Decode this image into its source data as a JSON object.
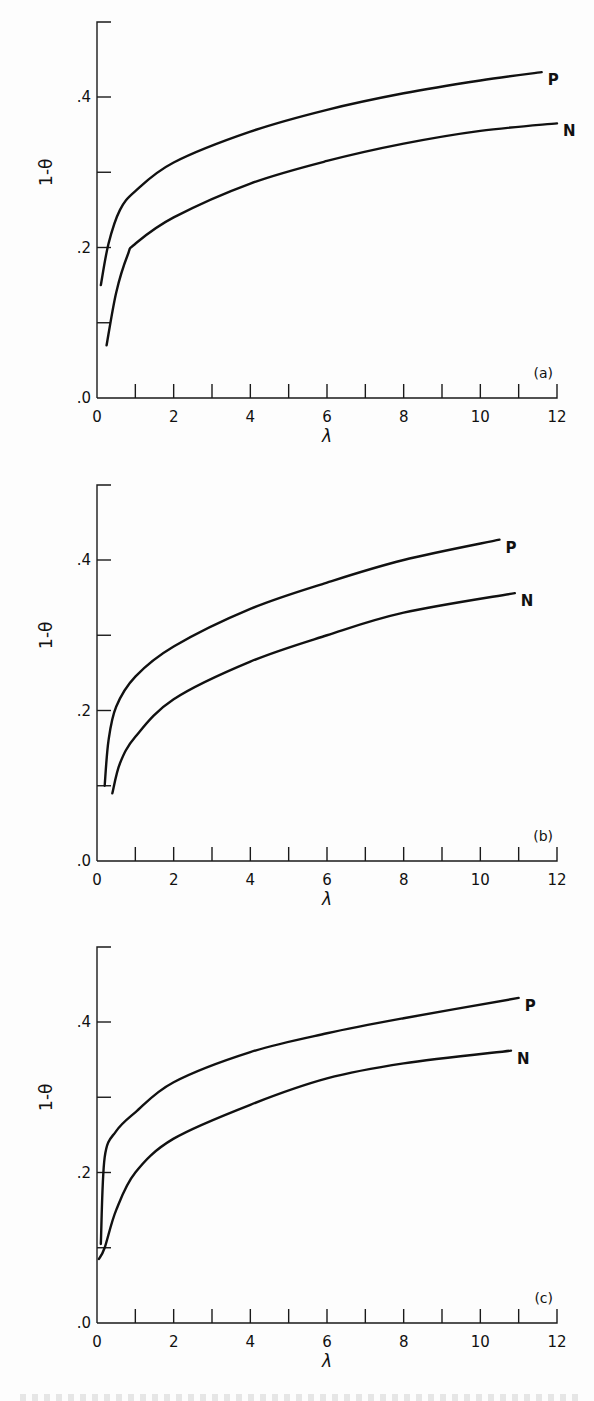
{
  "figure": {
    "y_label": "1-θ",
    "x_label": "λ",
    "x_ticks": [
      "0",
      "2",
      "4",
      "6",
      "8",
      "10",
      "12"
    ],
    "y_ticks": [
      ".0",
      ".2",
      ".4"
    ]
  },
  "chart_data": [
    {
      "type": "line",
      "panel_label": "(a)",
      "xlabel": "λ",
      "ylabel": "1-θ",
      "xlim": [
        0,
        12
      ],
      "ylim": [
        0,
        0.5
      ],
      "x_ticks": [
        0,
        2,
        4,
        6,
        8,
        10,
        12
      ],
      "y_ticks": [
        0.0,
        0.2,
        0.4
      ],
      "grid": false,
      "series": [
        {
          "name": "P",
          "x": [
            0.1,
            0.3,
            0.6,
            1,
            2,
            4,
            6,
            8,
            10,
            11.6
          ],
          "values": [
            0.15,
            0.205,
            0.25,
            0.275,
            0.313,
            0.354,
            0.383,
            0.405,
            0.422,
            0.433
          ]
        },
        {
          "name": "N",
          "x": [
            0.25,
            0.5,
            0.8,
            1,
            2,
            4,
            6,
            8,
            10,
            12
          ],
          "values": [
            0.07,
            0.14,
            0.19,
            0.205,
            0.24,
            0.285,
            0.315,
            0.338,
            0.355,
            0.365
          ]
        }
      ]
    },
    {
      "type": "line",
      "panel_label": "(b)",
      "xlabel": "λ",
      "ylabel": "1-θ",
      "xlim": [
        0,
        12
      ],
      "ylim": [
        0,
        0.5
      ],
      "x_ticks": [
        0,
        2,
        4,
        6,
        8,
        10,
        12
      ],
      "y_ticks": [
        0.0,
        0.2,
        0.4
      ],
      "grid": false,
      "series": [
        {
          "name": "P",
          "x": [
            0.2,
            0.3,
            0.5,
            1,
            2,
            4,
            6,
            8,
            10.5
          ],
          "values": [
            0.1,
            0.16,
            0.205,
            0.245,
            0.285,
            0.335,
            0.37,
            0.4,
            0.427
          ]
        },
        {
          "name": "N",
          "x": [
            0.4,
            0.6,
            1,
            2,
            4,
            6,
            8,
            10.9
          ],
          "values": [
            0.09,
            0.13,
            0.165,
            0.215,
            0.265,
            0.3,
            0.33,
            0.356
          ]
        }
      ]
    },
    {
      "type": "line",
      "panel_label": "(c)",
      "xlabel": "λ",
      "ylabel": "1-θ",
      "xlim": [
        0,
        12
      ],
      "ylim": [
        0,
        0.5
      ],
      "x_ticks": [
        0,
        2,
        4,
        6,
        8,
        10,
        12
      ],
      "y_ticks": [
        0.0,
        0.2,
        0.4
      ],
      "grid": false,
      "series": [
        {
          "name": "P",
          "x": [
            0.1,
            0.2,
            0.5,
            1,
            2,
            4,
            6,
            8,
            11
          ],
          "values": [
            0.105,
            0.22,
            0.255,
            0.28,
            0.32,
            0.36,
            0.385,
            0.405,
            0.432
          ]
        },
        {
          "name": "N",
          "x": [
            0.05,
            0.2,
            0.5,
            1,
            2,
            4,
            6,
            8,
            10.8
          ],
          "values": [
            0.085,
            0.1,
            0.15,
            0.2,
            0.245,
            0.29,
            0.325,
            0.345,
            0.362
          ]
        }
      ]
    }
  ]
}
